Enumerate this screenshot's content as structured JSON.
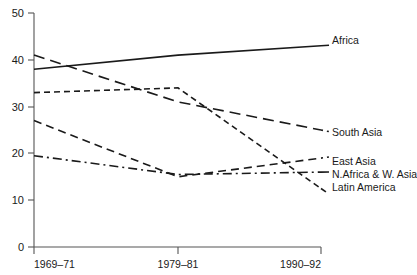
{
  "chart_data": {
    "type": "line",
    "title": "",
    "subtitle": "",
    "xlabel": "",
    "ylabel": "",
    "x": [
      "1969–71",
      "1979–81",
      "1990–92"
    ],
    "categories": [
      "1969–71",
      "1979–81",
      "1990–92"
    ],
    "xticklabels": [
      "1969–71",
      "1979–81",
      "1990–92"
    ],
    "yticklabels": [
      "0",
      "10",
      "20",
      "30",
      "40",
      "50"
    ],
    "ytickvalues": [
      0,
      10,
      20,
      30,
      40,
      50
    ],
    "ylim": [
      0,
      50
    ],
    "grid": false,
    "legend_position": "right-inline-labels",
    "series": [
      {
        "name": "Africa",
        "label": "Africa",
        "style": "solid",
        "values": [
          38,
          41,
          43
        ]
      },
      {
        "name": "South Asia",
        "label": "South Asia",
        "style": "long-dash",
        "values": [
          41,
          31,
          25
        ]
      },
      {
        "name": "East Asia",
        "label": "East Asia",
        "style": "medium-dash",
        "values": [
          27,
          15,
          19
        ]
      },
      {
        "name": "N.Africa & W. Asia",
        "label": "N.Africa & W. Asia",
        "style": "dash-dot",
        "values": [
          19.5,
          15.5,
          16
        ]
      },
      {
        "name": "Latin America",
        "label": "Latin America",
        "style": "short-dash",
        "values": [
          33,
          34,
          12.5
        ]
      }
    ],
    "colors": {
      "line": "#1a1a1a",
      "axis": "#555555",
      "background": "#ffffff"
    }
  },
  "axis": {
    "y_ticks": [
      {
        "label": "50",
        "value": 50
      },
      {
        "label": "40",
        "value": 40
      },
      {
        "label": "30",
        "value": 30
      },
      {
        "label": "20",
        "value": 20
      },
      {
        "label": "10",
        "value": 10
      },
      {
        "label": "0",
        "value": 0
      }
    ],
    "x_ticks": [
      {
        "label": "1969–71"
      },
      {
        "label": "1979–81"
      },
      {
        "label": "1990–92"
      }
    ]
  },
  "labels": {
    "africa": "Africa",
    "south_asia": "South Asia",
    "east_asia": "East Asia",
    "n_africa_w_asia": "N.Africa & W. Asia",
    "latin_america": "Latin America"
  }
}
